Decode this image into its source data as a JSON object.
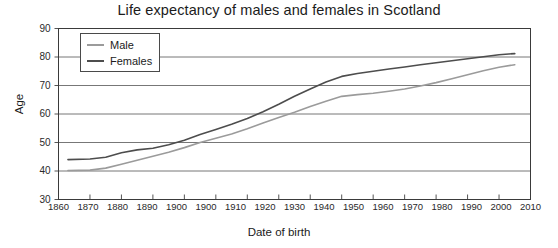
{
  "chart_data": {
    "type": "line",
    "title": "Life expectancy of males and females in Scotland",
    "xlabel": "Date of birth",
    "ylabel": "Age",
    "xlim": [
      1860,
      2010
    ],
    "ylim": [
      30,
      90
    ],
    "grid": true,
    "legend_position": "top-left",
    "x_ticks": [
      "1860",
      "1870",
      "1880",
      "1890",
      "1900",
      "1900",
      "1910",
      "1920",
      "1930",
      "1940",
      "1950",
      "1960",
      "1970",
      "1980",
      "1990",
      "2000",
      "2010"
    ],
    "x_tick_values": [
      1860,
      1870,
      1880,
      1890,
      1900,
      1910,
      1920,
      1930,
      1940,
      1950,
      1960,
      1970,
      1980,
      1990,
      2000,
      2010
    ],
    "y_ticks": [
      "30",
      "40",
      "50",
      "60",
      "70",
      "80",
      "90"
    ],
    "y_tick_values": [
      30,
      40,
      50,
      60,
      70,
      80,
      90
    ],
    "x": [
      1863,
      1870,
      1875,
      1880,
      1885,
      1890,
      1895,
      1900,
      1905,
      1910,
      1915,
      1920,
      1925,
      1930,
      1935,
      1940,
      1945,
      1950,
      1955,
      1960,
      1965,
      1970,
      1975,
      1980,
      1985,
      1990,
      1995,
      2000,
      2005
    ],
    "series": [
      {
        "name": "Male",
        "color": "#9b9b9b",
        "values": [
          40.2,
          40.3,
          41.0,
          42.4,
          43.8,
          45.2,
          46.6,
          48.2,
          50.0,
          51.5,
          53.0,
          54.8,
          56.8,
          58.8,
          60.6,
          62.6,
          64.5,
          66.2,
          66.8,
          67.3,
          68.0,
          68.8,
          69.8,
          71.0,
          72.4,
          73.8,
          75.2,
          76.4,
          77.3
        ]
      },
      {
        "name": "Females",
        "color": "#4d4d4d",
        "values": [
          44.0,
          44.2,
          44.8,
          46.4,
          47.4,
          48.0,
          49.2,
          50.8,
          52.8,
          54.6,
          56.4,
          58.4,
          60.8,
          63.4,
          66.2,
          68.8,
          71.2,
          73.2,
          74.2,
          75.0,
          75.8,
          76.5,
          77.3,
          78.0,
          78.7,
          79.4,
          80.1,
          80.8,
          81.2
        ]
      }
    ]
  },
  "legend": {
    "items": [
      {
        "label": "Male"
      },
      {
        "label": "Females"
      }
    ]
  }
}
